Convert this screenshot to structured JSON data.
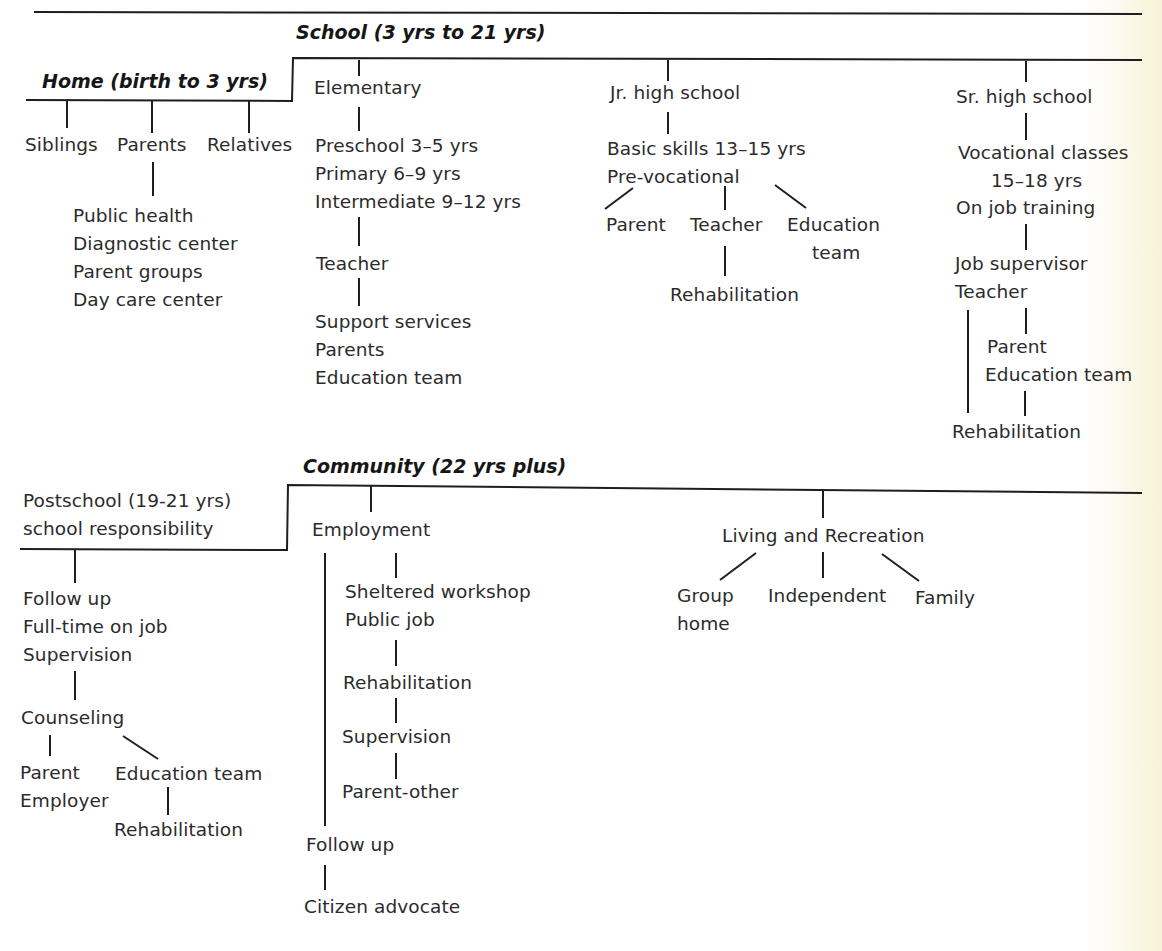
{
  "diagram": {
    "sections": {
      "home": {
        "heading": "Home (birth to 3 yrs)",
        "children": [
          "Siblings",
          "Parents",
          "Relatives"
        ],
        "parents_resources": [
          "Public health",
          "Diagnostic center",
          "Parent groups",
          "Day care center"
        ]
      },
      "school": {
        "heading": "School (3 yrs to 21 yrs)",
        "elementary": {
          "label": "Elementary",
          "levels": [
            "Preschool  3–5 yrs",
            "Primary  6–9 yrs",
            "Intermediate 9–12 yrs"
          ],
          "teacher": "Teacher",
          "support": [
            "Support  services",
            "Parents",
            "Education  team"
          ]
        },
        "jr_high": {
          "label": "Jr. high school",
          "levels": [
            "Basic skills 13–15 yrs",
            "Pre-vocational"
          ],
          "branches": [
            "Parent",
            "Teacher",
            "Education",
            "team"
          ],
          "rehab": "Rehabilitation"
        },
        "sr_high": {
          "label": "Sr. high school",
          "vocational": [
            "Vocational  classes",
            "15–18 yrs",
            "On job training"
          ],
          "supervisors": [
            "Job supervisor",
            "Teacher"
          ],
          "parent_team": [
            "Parent",
            "Education team"
          ],
          "rehab": "Rehabilitation"
        }
      },
      "postschool": {
        "heading": [
          "Postschool  (19-21 yrs)",
          "school  responsibility"
        ],
        "followup": [
          "Follow up",
          "Full-time on job",
          "Supervision"
        ],
        "counseling": "Counseling",
        "parent_employer": [
          "Parent",
          "Employer"
        ],
        "education_team": "Education team",
        "rehab": "Rehabilitation"
      },
      "community": {
        "heading": "Community (22 yrs plus)",
        "employment": {
          "label": "Employment",
          "jobs": [
            "Sheltered  workshop",
            "Public job"
          ],
          "rehab": "Rehabilitation",
          "supervision": "Supervision",
          "parent_other": "Parent-other",
          "followup": "Follow up",
          "advocate": "Citizen advocate"
        },
        "living": {
          "label": "Living and Recreation",
          "options": [
            "Group",
            "home",
            "Independent",
            "Family"
          ]
        }
      }
    }
  }
}
